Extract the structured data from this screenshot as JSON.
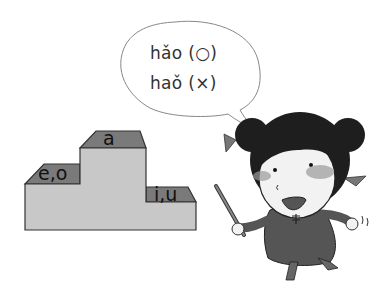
{
  "speech_bubble": {
    "line1": "hǎo (○)",
    "line2": "haǒ (×)"
  },
  "podium": {
    "top_label": "a",
    "left_label": "e,o",
    "right_label": "i,u"
  },
  "colors": {
    "podium_face": "#c8c8c8",
    "podium_top": "#7a7a7a",
    "hair": "#1e1e1e",
    "dress": "#555555",
    "skin": "#f2f2f2",
    "blush": "#9a9a9a"
  }
}
